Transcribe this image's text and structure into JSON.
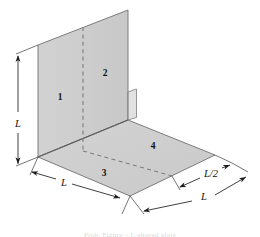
{
  "figure": {
    "caption": "Prob. Figure – L-shaped plate",
    "colors": {
      "surface_fill": "#cdcdcd",
      "surface_fill_light": "#d4d4d4",
      "outline": "#6f6f6f",
      "dimension_line": "#2a2a2a",
      "dashed_line": "#7a7a7a",
      "background": "#ffffff",
      "label_text": "#111111"
    },
    "region_labels": [
      {
        "id": "region-1",
        "text": "1",
        "x": 60,
        "y": 97
      },
      {
        "id": "region-2",
        "text": "2",
        "x": 104,
        "y": 73
      },
      {
        "id": "region-3",
        "text": "3",
        "x": 104,
        "y": 173
      },
      {
        "id": "region-4",
        "text": "4",
        "x": 152,
        "y": 146
      }
    ],
    "dimension_labels": [
      {
        "id": "dim-height-left",
        "text": "L",
        "x": 14,
        "y": 123
      },
      {
        "id": "dim-depth-bottom-left",
        "text": "L",
        "x": 62,
        "y": 196
      },
      {
        "id": "dim-half-right",
        "text": "L/2",
        "x": 212,
        "y": 180
      },
      {
        "id": "dim-width-bottom-right",
        "text": "L",
        "x": 205,
        "y": 205
      }
    ],
    "geometry": {
      "wall_polygon": "38,45 128,10 128,120 38,157",
      "floor_polygon": "38,157 128,120 215,155 130,196",
      "flange_polygon": "128,92 136,89 136,118 128,120",
      "dashed_wall_line": {
        "x1": 83,
        "y1": 27,
        "x2": 83,
        "y2": 151
      },
      "dashed_floor_line": {
        "x1": 83,
        "y1": 151,
        "x2": 172,
        "y2": 176
      }
    }
  }
}
